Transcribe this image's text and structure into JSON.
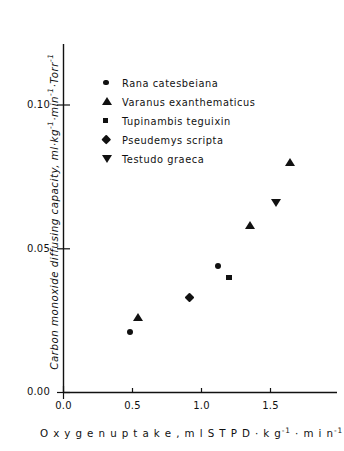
{
  "chart_data": {
    "type": "scatter",
    "title": "",
    "xlabel": "Oxygen uptake, ml STPD · kg-1 · min-1",
    "ylabel": "Carbon monoxide diffusing capacity, ml·kg-1·min-1·Torr-1",
    "xlim": [
      0.0,
      2.0
    ],
    "ylim": [
      0.0,
      0.115
    ],
    "grid": false,
    "legend_position": "upper-left-inside",
    "xticks": [
      "0.0",
      "0.5",
      "1.0",
      "1.5"
    ],
    "xtick_values": [
      0.0,
      0.5,
      1.0,
      1.5
    ],
    "yticks": [
      "0.00",
      "0.05",
      "0.10"
    ],
    "ytick_values": [
      0.0,
      0.05,
      0.1
    ],
    "series": [
      {
        "name": "Rana catesbeiana",
        "marker": "circle",
        "points": [
          {
            "x": 0.48,
            "y": 0.021
          },
          {
            "x": 1.12,
            "y": 0.044
          }
        ]
      },
      {
        "name": "Varanus exanthematicus",
        "marker": "triangle-up",
        "points": [
          {
            "x": 0.54,
            "y": 0.026
          },
          {
            "x": 1.35,
            "y": 0.058
          },
          {
            "x": 1.64,
            "y": 0.08
          }
        ]
      },
      {
        "name": "Tupinambis teguixin",
        "marker": "square",
        "points": [
          {
            "x": 1.2,
            "y": 0.04
          }
        ]
      },
      {
        "name": "Pseudemys scripta",
        "marker": "diamond",
        "points": [
          {
            "x": 0.91,
            "y": 0.033
          }
        ]
      },
      {
        "name": "Testudo graeca",
        "marker": "triangle-down",
        "points": [
          {
            "x": 1.54,
            "y": 0.066
          }
        ]
      }
    ]
  },
  "axis_titles": {
    "y_prefix": "Carbon monoxide diffusing capacity, ml·kg",
    "y_sup1": "-1",
    "y_mid1": "·min",
    "y_sup2": "-1",
    "y_mid2": "·Torr",
    "y_sup3": "-1",
    "x_prefix": "O x y g e n   u p t a k e ,  m l S T P D  ·  k g",
    "x_sup1": "-1",
    "x_mid1": " ·  m i n",
    "x_sup2": "-1"
  },
  "legend": {
    "entries": [
      {
        "label": "Rana catesbeiana",
        "marker": "circle"
      },
      {
        "label": "Varanus exanthematicus",
        "marker": "triangle-up"
      },
      {
        "label": "Tupinambis teguixin",
        "marker": "square"
      },
      {
        "label": "Pseudemys scripta",
        "marker": "diamond"
      },
      {
        "label": "Testudo graeca",
        "marker": "triangle-down"
      }
    ]
  },
  "style": {
    "ink": "#111111",
    "background": "#ffffff"
  }
}
